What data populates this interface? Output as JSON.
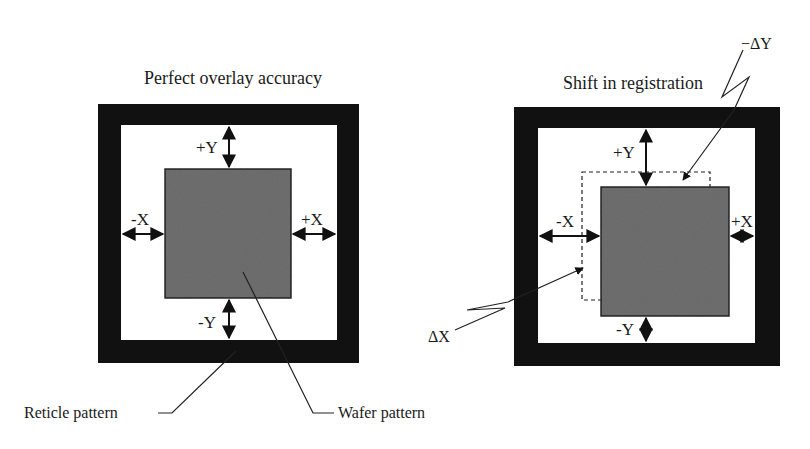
{
  "colors": {
    "frame": "#111111",
    "wafer": "#6e6e6e",
    "wafer_border": "#222222",
    "line": "#1a1a1a",
    "background": "#ffffff"
  },
  "left_panel": {
    "title": "Perfect overlay accuracy",
    "labels": {
      "plus_y": "+Y",
      "minus_y": "-Y",
      "minus_x": "-X",
      "plus_x": "+X"
    },
    "callouts": {
      "reticle": "Reticle pattern",
      "wafer": "Wafer pattern"
    }
  },
  "right_panel": {
    "title": "Shift in registration",
    "labels": {
      "plus_y": "+Y",
      "minus_y": "-Y",
      "minus_x": "-X",
      "plus_x": "+X"
    },
    "callouts": {
      "delta_y": "−ΔY",
      "delta_x": "ΔX"
    }
  }
}
